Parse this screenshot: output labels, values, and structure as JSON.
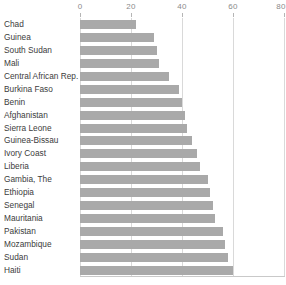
{
  "chart_data": {
    "type": "bar",
    "orientation": "horizontal",
    "title": "",
    "subtitle": "",
    "xlabel": "",
    "ylabel": "",
    "xlim": [
      0,
      80
    ],
    "xticks": [
      0,
      20,
      40,
      60,
      80
    ],
    "xtick_labels": [
      "0",
      "20",
      "40",
      "60",
      "80"
    ],
    "axis_position": "top",
    "grid": true,
    "grid_axis": "x",
    "legend": false,
    "bar_color": "#a9a9a9",
    "grid_color": "#d9d9d9",
    "label_color": "#3c3c3c",
    "tick_color": "#8a8a8a",
    "categories": [
      "Chad",
      "Guinea",
      "South Sudan",
      "Mali",
      "Central African Rep.",
      "Burkina Faso",
      "Benin",
      "Afghanistan",
      "Sierra Leone",
      "Guinea-Bissau",
      "Ivory Coast",
      "Liberia",
      "Gambia, The",
      "Ethiopia",
      "Senegal",
      "Mauritania",
      "Pakistan",
      "Mozambique",
      "Sudan",
      "Haiti"
    ],
    "values": [
      22,
      29,
      30,
      31,
      35,
      39,
      40,
      41,
      42,
      44,
      46,
      47,
      50,
      51,
      52,
      53,
      56,
      57,
      58,
      60
    ]
  }
}
